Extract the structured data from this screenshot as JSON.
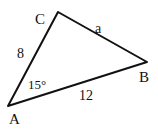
{
  "diagram": {
    "type": "triangle",
    "vertices": {
      "A": {
        "label": "A",
        "x": 8,
        "y": 106
      },
      "B": {
        "label": "B",
        "x": 147,
        "y": 62
      },
      "C": {
        "label": "C",
        "x": 58,
        "y": 12
      }
    },
    "sides": {
      "AC": {
        "label": "8"
      },
      "AB": {
        "label": "12"
      },
      "CB": {
        "label": "a"
      }
    },
    "angles": {
      "A": {
        "label": "15°"
      }
    },
    "colors": {
      "stroke": "#111111",
      "background": "#ffffff"
    }
  }
}
